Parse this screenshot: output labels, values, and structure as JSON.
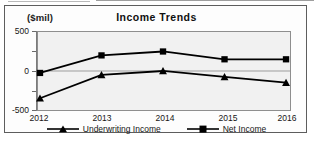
{
  "figure": {
    "unit_label": "($mil)",
    "title": "Income Trends"
  },
  "legend": {
    "items": [
      {
        "label": "Underwriting Income",
        "marker": "triangle-marker-icon",
        "color": "#000000"
      },
      {
        "label": "Net Income",
        "marker": "square-marker-icon",
        "color": "#000000"
      }
    ]
  },
  "chart_data": {
    "type": "line",
    "title": "Income Trends",
    "xlabel": "",
    "ylabel": "($mil)",
    "categories": [
      "2012",
      "2013",
      "2014",
      "2015",
      "2016"
    ],
    "x_tick_labels": [
      "2012",
      "2013",
      "2014",
      "2015",
      "2016"
    ],
    "y_tick_labels": [
      "500",
      "0",
      "-500"
    ],
    "y_ticks": [
      500,
      0,
      -500
    ],
    "ylim": [
      -500,
      500
    ],
    "grid": "horizontal-zero-line",
    "legend_position": "bottom-center",
    "series": [
      {
        "name": "Underwriting Income",
        "marker": "triangle",
        "color": "#000000",
        "values": [
          -350,
          -50,
          0,
          -75,
          -150
        ]
      },
      {
        "name": "Net Income",
        "marker": "square",
        "color": "#000000",
        "values": [
          -25,
          200,
          250,
          150,
          150
        ]
      }
    ]
  }
}
